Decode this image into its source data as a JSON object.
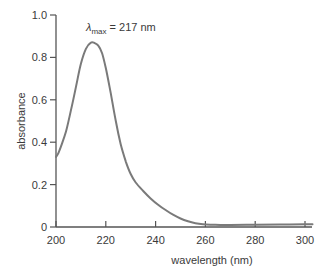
{
  "chart_data": {
    "type": "line",
    "title": "",
    "xlabel": "wavelength (nm)",
    "ylabel": "absorbance",
    "xlim": [
      200,
      303
    ],
    "ylim": [
      0,
      1.0
    ],
    "grid": false,
    "legend": null,
    "x_ticks": [
      200,
      220,
      240,
      260,
      280,
      300
    ],
    "y_ticks": [
      0,
      0.2,
      0.4,
      0.6,
      0.8,
      1.0
    ],
    "y_tick_labels": [
      "0",
      "0.2",
      "0.4",
      "0.6",
      "0.8",
      "1.0"
    ],
    "annotation": {
      "symbol": "λ",
      "subscript": "max",
      "text": " = 217 nm",
      "x": 217,
      "y": 0.93
    },
    "series": [
      {
        "name": "absorbance",
        "color": "#7a7a7a",
        "x": [
          200,
          201,
          202,
          204,
          206,
          208,
          210,
          212,
          214,
          215.5,
          217,
          218.5,
          220,
          222,
          224,
          226,
          228,
          230,
          232,
          235,
          238,
          241,
          244,
          247,
          250,
          253,
          256,
          259,
          262,
          266,
          270,
          280,
          290,
          300,
          303
        ],
        "values": [
          0.33,
          0.35,
          0.38,
          0.45,
          0.55,
          0.66,
          0.77,
          0.84,
          0.87,
          0.868,
          0.855,
          0.82,
          0.75,
          0.63,
          0.5,
          0.39,
          0.31,
          0.25,
          0.21,
          0.17,
          0.135,
          0.105,
          0.08,
          0.058,
          0.04,
          0.027,
          0.018,
          0.013,
          0.011,
          0.01,
          0.01,
          0.011,
          0.012,
          0.013,
          0.013
        ]
      }
    ]
  }
}
